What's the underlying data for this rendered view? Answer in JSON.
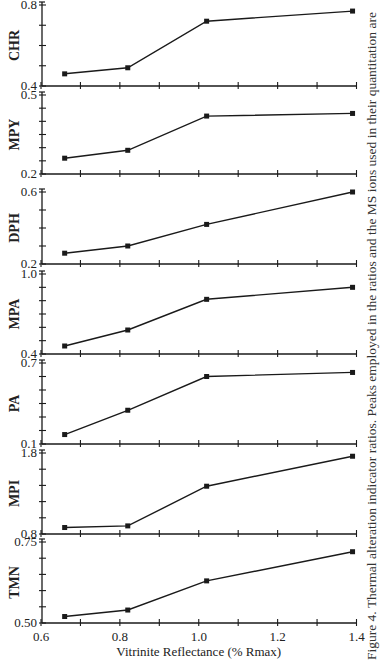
{
  "chart_data": {
    "type": "line",
    "layout": "stacked-panels",
    "title": "",
    "xlabel": "Vitrinite Reflectance (% Rmax)",
    "xlim": [
      0.6,
      1.4
    ],
    "x_ticks": [
      0.6,
      0.7,
      0.8,
      0.9,
      1.0,
      1.1,
      1.2,
      1.3,
      1.4
    ],
    "x_tick_labels": [
      "0.6",
      "",
      "0.8",
      "",
      "1.0",
      "",
      "1.2",
      "",
      "1.4"
    ],
    "x": [
      0.66,
      0.82,
      1.02,
      1.39
    ],
    "grid": false,
    "legend": "none",
    "marker": "square",
    "panels": [
      {
        "name": "CHR",
        "ylabel": "CHR",
        "ylim": [
          0.4,
          0.8
        ],
        "y_ticks": [
          0.4,
          0.5,
          0.6,
          0.7,
          0.8
        ],
        "y_tick_labels": [
          "0.4",
          "0.8"
        ],
        "values": [
          0.46,
          0.49,
          0.72,
          0.77
        ]
      },
      {
        "name": "MPY",
        "ylabel": "MPY",
        "ylim": [
          0.2,
          0.5
        ],
        "y_ticks": [
          0.2,
          0.25,
          0.3,
          0.35,
          0.4,
          0.45,
          0.5
        ],
        "y_tick_labels": [
          "0.2",
          "0.5"
        ],
        "values": [
          0.26,
          0.29,
          0.42,
          0.43
        ]
      },
      {
        "name": "DPH",
        "ylabel": "DPH",
        "ylim": [
          0.2,
          0.6
        ],
        "y_ticks": [
          0.2,
          0.3,
          0.4,
          0.5,
          0.6
        ],
        "y_tick_labels": [
          "0.2",
          "0.6"
        ],
        "values": [
          0.26,
          0.3,
          0.42,
          0.6
        ]
      },
      {
        "name": "MPA",
        "ylabel": "MPA",
        "ylim": [
          0.4,
          1.0
        ],
        "y_ticks": [
          0.4,
          0.5,
          0.6,
          0.7,
          0.8,
          0.9,
          1.0
        ],
        "y_tick_labels": [
          "0.4",
          "1.0"
        ],
        "values": [
          0.46,
          0.58,
          0.81,
          0.9
        ]
      },
      {
        "name": "PA",
        "ylabel": "PA",
        "ylim": [
          0.1,
          0.7
        ],
        "y_ticks": [
          0.1,
          0.2,
          0.3,
          0.4,
          0.5,
          0.6,
          0.7
        ],
        "y_tick_labels": [
          "0.1",
          "0.7"
        ],
        "values": [
          0.17,
          0.35,
          0.6,
          0.63
        ]
      },
      {
        "name": "MPI",
        "ylabel": "MPI",
        "ylim": [
          0.8,
          1.8
        ],
        "y_ticks": [
          0.8,
          1.0,
          1.2,
          1.4,
          1.6,
          1.8
        ],
        "y_tick_labels": [
          "0.8",
          "1.8"
        ],
        "values": [
          0.88,
          0.9,
          1.39,
          1.76
        ]
      },
      {
        "name": "TMN",
        "ylabel": "TMN",
        "ylim": [
          0.5,
          0.75
        ],
        "y_ticks": [
          0.5,
          0.55,
          0.6,
          0.65,
          0.7,
          0.75
        ],
        "y_tick_labels": [
          "0.50",
          "0.75"
        ],
        "values": [
          0.52,
          0.54,
          0.63,
          0.72
        ]
      }
    ],
    "caption": "Figure 4.  Thermal alteration indicator ratios.  Peaks employed in the ratios and the MS ions used in their quantitation are"
  },
  "colors": {
    "ink": "#1a1a1a",
    "background": "#ffffff"
  }
}
